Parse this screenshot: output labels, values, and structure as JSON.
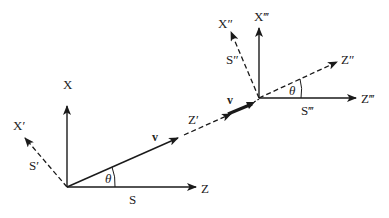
{
  "diagram": {
    "type": "reference-frame-transformation",
    "colors": {
      "line": "#1a1a1a",
      "text": "#222222",
      "background": "#ffffff"
    },
    "left_frame": {
      "origin": [
        67,
        187
      ],
      "axes": {
        "x": {
          "label": "X",
          "style": "solid"
        },
        "z": {
          "label": "Z",
          "style": "solid"
        },
        "x_prime": {
          "label": "X′",
          "style": "dashed"
        },
        "z_prime": {
          "label": "Z′",
          "style": "dashed"
        }
      },
      "frame_labels": {
        "s": "S",
        "s_prime": "S′"
      },
      "velocity": {
        "label": "v"
      },
      "angle": {
        "label": "θ"
      }
    },
    "right_frame": {
      "origin": [
        259,
        98
      ],
      "axes": {
        "x_triple": {
          "label": "X‴",
          "style": "solid"
        },
        "z_triple": {
          "label": "Z‴",
          "style": "solid"
        },
        "x_double": {
          "label": "X″",
          "style": "dashed"
        },
        "z_double": {
          "label": "Z″",
          "style": "dashed"
        }
      },
      "frame_labels": {
        "s_double": "S″",
        "s_triple": "S‴"
      },
      "velocity": {
        "label": "v"
      },
      "angle": {
        "label": "θ"
      }
    }
  }
}
